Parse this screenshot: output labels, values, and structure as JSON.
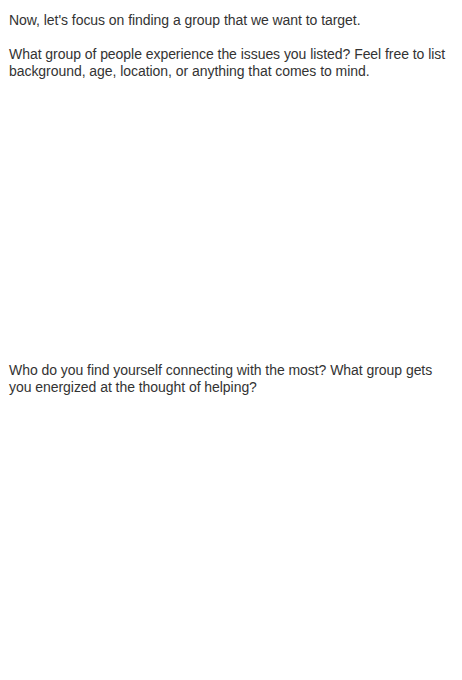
{
  "intro": {
    "text": "Now, let's focus on finding a group that we want to target."
  },
  "questions": [
    {
      "prompt_line1": "What group of people experience the issues you listed? Feel free to list",
      "prompt_line2": "background, age, location, or anything that comes to mind.",
      "answer_value": ""
    },
    {
      "prompt_line1": "Who do you find yourself connecting with the most? What group gets",
      "prompt_line2": "you energized at the thought of helping?",
      "answer_value": ""
    }
  ],
  "colors": {
    "text": "#333333",
    "background": "#ffffff"
  }
}
